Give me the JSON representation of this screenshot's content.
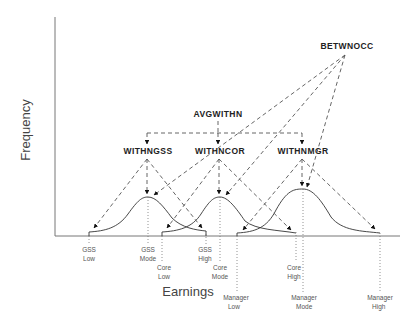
{
  "axes": {
    "y_label": "Frequency",
    "x_label": "Earnings"
  },
  "nodes": {
    "between": "BETWNOCC",
    "avg_within": "AVGWITHN",
    "within_gss": "WITHNGSS",
    "within_core": "WITHNCOR",
    "within_mgr": "WITHNMGR"
  },
  "ticks": {
    "gss_low": [
      "GSS",
      "Low"
    ],
    "gss_mode": [
      "GSS",
      "Mode"
    ],
    "gss_high": [
      "GSS",
      "High"
    ],
    "core_low": [
      "Core",
      "Low"
    ],
    "core_mode": [
      "Core",
      "Mode"
    ],
    "core_high": [
      "Core",
      "High"
    ],
    "mgr_low": [
      "Manager",
      "Low"
    ],
    "mgr_mode": [
      "Manager",
      "Mode"
    ],
    "mgr_high": [
      "Manager",
      "High"
    ]
  },
  "distributions": [
    {
      "name": "GSS",
      "low_x": 89,
      "mode_x": 148,
      "high_x": 206
    },
    {
      "name": "Core",
      "low_x": 162,
      "mode_x": 220,
      "high_x": 296
    },
    {
      "name": "Manager",
      "low_x": 237,
      "mode_x": 303,
      "high_x": 380
    }
  ]
}
